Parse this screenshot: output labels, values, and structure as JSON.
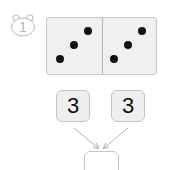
{
  "problem": {
    "number": "1",
    "badge_icon": "bear-head-icon"
  },
  "domino": {
    "left_pips": 3,
    "right_pips": 3
  },
  "number_boxes": [
    {
      "value": "3"
    },
    {
      "value": "3"
    }
  ],
  "answer_box": {
    "value": ""
  },
  "colors": {
    "domino_fill": "#f0f0f0",
    "pip": "#111111",
    "border": "#c4c4c4",
    "arrow": "#b0b0b0"
  }
}
